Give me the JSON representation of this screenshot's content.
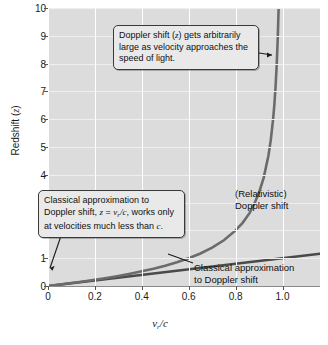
{
  "chart_data": {
    "type": "line",
    "title": "",
    "xlabel": "v_r/c",
    "xlabel_parts": {
      "v": "v",
      "sub": "r",
      "rest": "/c"
    },
    "ylabel": "Redshift (z)",
    "xlim": [
      0,
      1.16
    ],
    "ylim": [
      0,
      10
    ],
    "grid": true,
    "legend": "none",
    "xticks": [
      "0",
      "0.2",
      "0.4",
      "0.6",
      "0.8",
      "1.0"
    ],
    "xtick_values": [
      0,
      0.2,
      0.4,
      0.6,
      0.8,
      1.0
    ],
    "yticks": [
      "0",
      "1",
      "2",
      "3",
      "4",
      "5",
      "6",
      "7",
      "8",
      "9",
      "10"
    ],
    "ytick_values": [
      0,
      1,
      2,
      3,
      4,
      5,
      6,
      7,
      8,
      9,
      10
    ],
    "asymptote_x": 1.0,
    "series": [
      {
        "name": "(Relativistic) Doppler shift",
        "color": "#6b6b6b",
        "x": [
          0.0,
          0.05,
          0.1,
          0.15,
          0.2,
          0.25,
          0.3,
          0.35,
          0.4,
          0.45,
          0.5,
          0.55,
          0.6,
          0.65,
          0.7,
          0.75,
          0.8,
          0.83,
          0.86,
          0.88,
          0.9,
          0.92,
          0.94,
          0.95,
          0.96,
          0.965,
          0.97,
          0.975,
          0.98,
          0.9835
        ],
        "values": [
          0.0,
          0.051,
          0.106,
          0.162,
          0.225,
          0.291,
          0.363,
          0.442,
          0.528,
          0.623,
          0.732,
          0.852,
          1.0,
          1.171,
          1.383,
          1.646,
          2.0,
          2.272,
          2.63,
          2.956,
          3.359,
          3.899,
          4.684,
          5.245,
          6.0,
          6.49,
          7.105,
          7.888,
          8.95,
          9.97
        ]
      },
      {
        "name": "Classical approximation to Doppler shift",
        "color": "#4a4a4a",
        "x": [
          0.0,
          1.16
        ],
        "values": [
          0.0,
          1.16
        ]
      }
    ],
    "annotations": [
      {
        "id": "callout-relativistic",
        "text": "Doppler shift (z) gets arbitrarily large as velocity approaches the speed of light.",
        "line1": "Doppler shift (",
        "italic1": "z",
        "line1b": ") gets arbitrarily",
        "line2": "large as velocity approaches",
        "line3": "the speed of light.",
        "points_to": "relativistic-curve"
      },
      {
        "id": "callout-classical",
        "text": "Classical approximation to Doppler shift, z = v_r/c, works only at velocities much less than c.",
        "line1": "Classical approximation to",
        "line2a": "Doppler shift, ",
        "line2_italic_z": "z",
        "line2_eq": " = ",
        "line2_italic_v": "v",
        "line2_sub": "r",
        "line2_c": "/c",
        "line2b": ", works only",
        "line3a": "at velocities much less than ",
        "line3_italic_c": "c",
        "line3b": ".",
        "points_to": "classical-line"
      }
    ],
    "curve_labels": [
      {
        "id": "label-relativistic",
        "line1": "(Relativistic)",
        "line2": "Doppler shift"
      },
      {
        "id": "label-classical",
        "line1": "Classical approximation",
        "line2": "to Doppler shift"
      }
    ]
  },
  "axes": {
    "ylabel_text": "Redshift (",
    "ylabel_italic": "z",
    "ylabel_tail": ")"
  },
  "caption": ""
}
